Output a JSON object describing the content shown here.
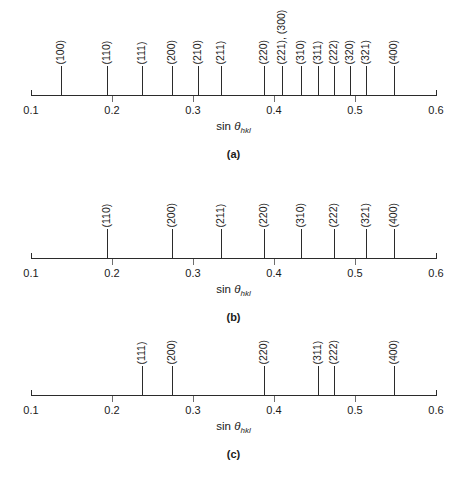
{
  "figure": {
    "axis": {
      "label_text": "sin ",
      "label_symbol": "θ",
      "label_subscript": "hkl",
      "min": 0.1,
      "max": 0.6,
      "ticks": [
        "0.1",
        "0.2",
        "0.3",
        "0.4",
        "0.5",
        "0.6"
      ],
      "tick_values": [
        0.1,
        0.2,
        0.3,
        0.4,
        0.5,
        0.6
      ],
      "minor_tick_values": [
        0.2,
        0.3,
        0.4,
        0.5
      ]
    },
    "panels": [
      {
        "caption": "(a)"
      },
      {
        "caption": "(b)"
      },
      {
        "caption": "(c)"
      }
    ]
  },
  "chart_data": [
    {
      "type": "bar",
      "title": "(a)",
      "xlabel": "sin θhkl",
      "ylabel": "",
      "xlim": [
        0.1,
        0.6
      ],
      "grid": false,
      "legend": "none",
      "categories": [
        "(100)",
        "(110)",
        "(111)",
        "(200)",
        "(210)",
        "(211)",
        "(220)",
        "(221), (300)",
        "(310)",
        "(311)",
        "(222)",
        "(320)",
        "(321)",
        "(400)"
      ],
      "x": [
        0.137,
        0.194,
        0.237,
        0.274,
        0.306,
        0.335,
        0.387,
        0.41,
        0.433,
        0.454,
        0.474,
        0.494,
        0.513,
        0.548
      ],
      "values": [
        1,
        1,
        1,
        1,
        1,
        1,
        1,
        1,
        1,
        1,
        1,
        1,
        1,
        1
      ],
      "label_raised": [
        false,
        false,
        false,
        false,
        false,
        false,
        false,
        true,
        false,
        false,
        false,
        false,
        false,
        false
      ]
    },
    {
      "type": "bar",
      "title": "(b)",
      "xlabel": "sin θhkl",
      "ylabel": "",
      "xlim": [
        0.1,
        0.6
      ],
      "grid": false,
      "legend": "none",
      "categories": [
        "(110)",
        "(200)",
        "(211)",
        "(220)",
        "(310)",
        "(222)",
        "(321)",
        "(400)"
      ],
      "x": [
        0.194,
        0.274,
        0.335,
        0.387,
        0.433,
        0.474,
        0.513,
        0.548
      ],
      "values": [
        1,
        1,
        1,
        1,
        1,
        1,
        1,
        1
      ],
      "label_raised": [
        false,
        false,
        false,
        false,
        false,
        false,
        false,
        false
      ]
    },
    {
      "type": "bar",
      "title": "(c)",
      "xlabel": "sin θhkl",
      "ylabel": "",
      "xlim": [
        0.1,
        0.6
      ],
      "grid": false,
      "legend": "none",
      "categories": [
        "(111)",
        "(200)",
        "(220)",
        "(311)",
        "(222)",
        "(400)"
      ],
      "x": [
        0.237,
        0.274,
        0.387,
        0.454,
        0.474,
        0.548
      ],
      "values": [
        1,
        1,
        1,
        1,
        1,
        1
      ],
      "label_raised": [
        false,
        false,
        false,
        false,
        false,
        false
      ]
    }
  ]
}
